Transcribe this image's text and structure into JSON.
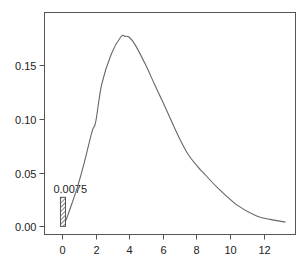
{
  "chart_data": {
    "type": "line",
    "title": "",
    "xlabel": "",
    "ylabel": "",
    "xlim": [
      -1.05,
      13.9
    ],
    "ylim": [
      -0.0075,
      0.1985
    ],
    "grid": false,
    "legend": null,
    "x_ticks": [
      0,
      2,
      4,
      6,
      8,
      10,
      12
    ],
    "x_tick_labels": [
      "0",
      "2",
      "4",
      "6",
      "8",
      "10",
      "12"
    ],
    "y_ticks": [
      0.0,
      0.05,
      0.1,
      0.15
    ],
    "y_tick_labels": [
      "0.00",
      "0.05",
      "0.10",
      "0.15"
    ],
    "series": [
      {
        "name": "density curve",
        "color": "#666666",
        "x": [
          0.23,
          0.6,
          0.92,
          1.3,
          1.78,
          2.0,
          2.36,
          2.93,
          3.5,
          3.74,
          4.0,
          4.37,
          5.0,
          5.5,
          6.1,
          6.95,
          7.5,
          8.1,
          8.4,
          9.25,
          10.4,
          11.55,
          12.4,
          13.3
        ],
        "y": [
          0.0056,
          0.022,
          0.037,
          0.058,
          0.088,
          0.097,
          0.132,
          0.16,
          0.176,
          0.1765,
          0.1755,
          0.168,
          0.149,
          0.132,
          0.112,
          0.083,
          0.067,
          0.055,
          0.05,
          0.036,
          0.02,
          0.01,
          0.0065,
          0.004
        ]
      }
    ],
    "bars": [
      {
        "name": "zero-mass bar",
        "x_left": -0.1,
        "x_right": 0.2,
        "value": 0.027,
        "label": "0.0075",
        "fill": "hatched",
        "color": "#555555"
      }
    ]
  }
}
